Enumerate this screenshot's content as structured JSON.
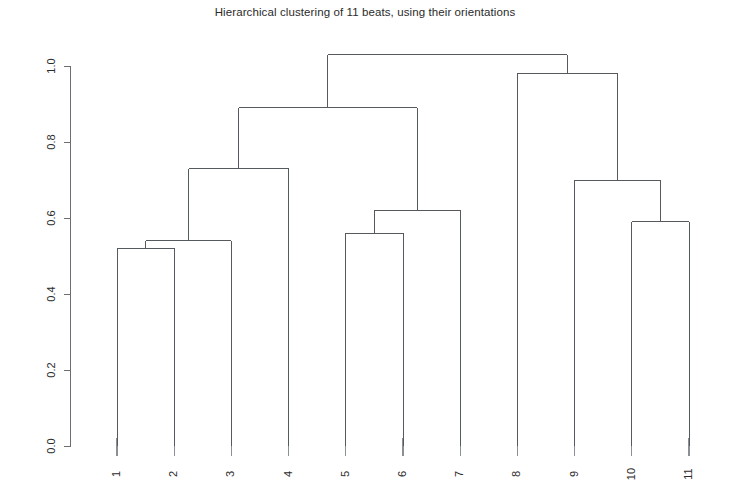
{
  "chart_data": {
    "type": "dendrogram",
    "title": "Hierarchical clustering of 11 beats, using their orientations",
    "xlabel": "",
    "ylabel": "",
    "ylim": [
      0.0,
      1.0
    ],
    "grid": false,
    "legend": null,
    "ytick_labels": [
      "0.0",
      "0.2",
      "0.4",
      "0.6",
      "0.8",
      "1.0"
    ],
    "ytick_values": [
      0.0,
      0.2,
      0.4,
      0.6,
      0.8,
      1.0
    ],
    "leaf_labels": [
      "1",
      "2",
      "3",
      "4",
      "5",
      "6",
      "7",
      "8",
      "9",
      "10",
      "11"
    ],
    "leaf_order": [
      1,
      2,
      3,
      4,
      5,
      6,
      7,
      8,
      9,
      10,
      11
    ],
    "merges": [
      {
        "id": "m1",
        "label": "1 + 2",
        "children": [
          "1",
          "2"
        ],
        "height": 0.52
      },
      {
        "id": "m2",
        "label": "(1,2) + 3",
        "children": [
          "m1",
          "3"
        ],
        "height": 0.54
      },
      {
        "id": "m3",
        "label": "(1,2,3) + 4",
        "children": [
          "m2",
          "4"
        ],
        "height": 0.73
      },
      {
        "id": "m4",
        "label": "5 + 6",
        "children": [
          "5",
          "6"
        ],
        "height": 0.56
      },
      {
        "id": "m5",
        "label": "(5,6) + 7",
        "children": [
          "m4",
          "7"
        ],
        "height": 0.62
      },
      {
        "id": "m6",
        "label": "(1,2,3,4) + (5,6,7)",
        "children": [
          "m3",
          "m5"
        ],
        "height": 0.89
      },
      {
        "id": "m7",
        "label": "10 + 11",
        "children": [
          "10",
          "11"
        ],
        "height": 0.59
      },
      {
        "id": "m8",
        "label": "9 + (10,11)",
        "children": [
          "9",
          "m7"
        ],
        "height": 0.7
      },
      {
        "id": "m9",
        "label": "8 + (9,10,11)",
        "children": [
          "8",
          "m8"
        ],
        "height": 0.98
      },
      {
        "id": "m10",
        "label": "root",
        "children": [
          "m6",
          "m9"
        ],
        "height": 1.03
      }
    ],
    "colors": {
      "line": "#555a5e",
      "axis": "#6a6f73",
      "text": "#2b2b2b",
      "background": "#ffffff"
    }
  }
}
